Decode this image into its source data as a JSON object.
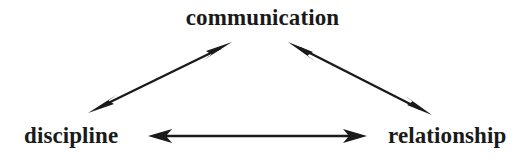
{
  "diagram": {
    "type": "triangle-relationship",
    "background_color": "#ffffff",
    "line_color": "#1a1a1a",
    "text_color": "#1a1a1a",
    "width": 525,
    "height": 164,
    "nodes": [
      {
        "id": "communication",
        "label": "communication",
        "position": "top-center",
        "x": 264,
        "y": 17
      },
      {
        "id": "discipline",
        "label": "discipline",
        "position": "bottom-left",
        "x": 77,
        "y": 136
      },
      {
        "id": "relationship",
        "label": "relationship",
        "position": "bottom-right",
        "x": 450,
        "y": 136
      }
    ],
    "edges": [
      {
        "id": "discipline-communication",
        "from": "discipline",
        "to": "communication",
        "style": "double-headed-arrow",
        "x1": 88,
        "y1": 113,
        "x2": 232,
        "y2": 42
      },
      {
        "id": "communication-relationship",
        "from": "communication",
        "to": "relationship",
        "style": "double-headed-arrow",
        "x1": 288,
        "y1": 42,
        "x2": 432,
        "y2": 115
      },
      {
        "id": "discipline-relationship",
        "from": "discipline",
        "to": "relationship",
        "style": "double-headed-arrow",
        "x1": 148,
        "y1": 136,
        "x2": 367,
        "y2": 136
      }
    ]
  }
}
